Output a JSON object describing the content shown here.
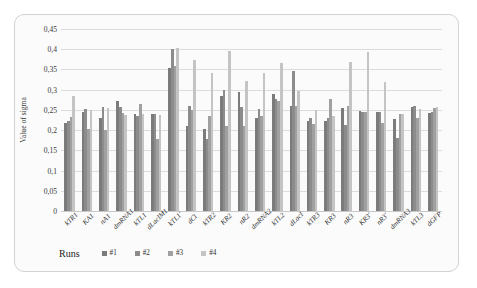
{
  "chart_data": {
    "type": "bar",
    "title": "",
    "xlabel": "",
    "ylabel": "Value of sigma",
    "ylim": [
      0,
      0.45
    ],
    "ytick_labels": [
      "0,45",
      "0,4",
      "0,35",
      "0,3",
      "0,25",
      "0,2",
      "0,15",
      "0,1",
      "0,05",
      "0"
    ],
    "ytick_values": [
      0.45,
      0.4,
      0.35,
      0.3,
      0.25,
      0.2,
      0.15,
      0.1,
      0.05,
      0
    ],
    "grid": true,
    "legend_position": "bottom",
    "legend_title": "Runs",
    "decimal_separator": ",",
    "categories": [
      "kTR1",
      "KA1",
      "nA1",
      "dmRNA1",
      "kTL1",
      "dLacIM1",
      "kTL1'",
      "dCl",
      "kTR2",
      "KR2",
      "nR2",
      "dmRNA2",
      "kTL2",
      "dLacI",
      "kTR3",
      "KR3",
      "nR3",
      "KR3'",
      "nR3'",
      "dmRNA3",
      "kTL3",
      "dGFP"
    ],
    "series": [
      {
        "name": "#1",
        "color": "#7b7b7b",
        "values": [
          0.218,
          0.244,
          0.23,
          0.271,
          0.239,
          0.241,
          0.353,
          0.209,
          0.203,
          0.285,
          0.294,
          0.23,
          0.289,
          0.259,
          0.223,
          0.222,
          0.254,
          0.248,
          0.244,
          0.228,
          0.258,
          0.242
        ]
      },
      {
        "name": "#2",
        "color": "#8c8c8c",
        "values": [
          0.223,
          0.253,
          0.256,
          0.258,
          0.236,
          0.241,
          0.401,
          0.259,
          0.178,
          0.3,
          0.258,
          0.252,
          0.278,
          0.346,
          0.23,
          0.23,
          0.213,
          0.246,
          0.245,
          0.181,
          0.26,
          0.246
        ]
      },
      {
        "name": "#3",
        "color": "#a0a0a0",
        "values": [
          0.232,
          0.203,
          0.2,
          0.242,
          0.264,
          0.178,
          0.359,
          0.25,
          0.234,
          0.209,
          0.209,
          0.234,
          0.273,
          0.26,
          0.215,
          0.278,
          0.26,
          0.244,
          0.218,
          0.241,
          0.231,
          0.255
        ]
      },
      {
        "name": "#4",
        "color": "#c4c4c4",
        "values": [
          0.284,
          0.25,
          0.255,
          0.238,
          0.24,
          0.238,
          0.403,
          0.374,
          0.342,
          0.396,
          0.321,
          0.341,
          0.365,
          0.297,
          0.249,
          0.236,
          0.368,
          0.392,
          0.32,
          0.241,
          0.252,
          0.257
        ]
      }
    ]
  },
  "legend": {
    "title": "Runs",
    "items": [
      {
        "label": "#1",
        "color": "#7b7b7b"
      },
      {
        "label": "#2",
        "color": "#8c8c8c"
      },
      {
        "label": "#3",
        "color": "#a0a0a0"
      },
      {
        "label": "#4",
        "color": "#c4c4c4"
      }
    ]
  }
}
